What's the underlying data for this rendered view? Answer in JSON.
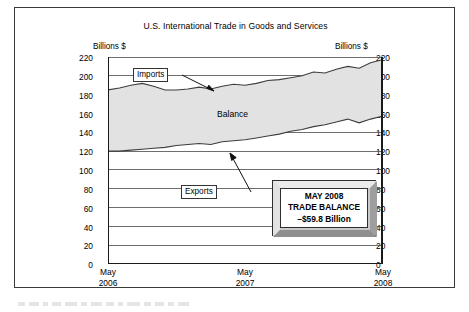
{
  "chart_data": {
    "type": "area",
    "title": "U.S. International Trade in Goods and Services",
    "xlabel": "",
    "ylabel": "Billions $",
    "units_left": "Billions $",
    "units_right": "Billions $",
    "ylim": [
      0,
      220
    ],
    "ytick_step": 20,
    "yticks": [
      0,
      20,
      40,
      60,
      80,
      100,
      120,
      140,
      160,
      180,
      200,
      220
    ],
    "grid": true,
    "grid_orientation": "horizontal",
    "legend_position": "inline-annotations",
    "x_tick_labels": [
      "May 2006",
      "May 2007",
      "May 2008"
    ],
    "x_tick_lines": [
      [
        "May",
        "2006"
      ],
      [
        "May",
        "2007"
      ],
      [
        "May",
        "2008"
      ]
    ],
    "x_minor_ticks": "monthly",
    "x": [
      "2006-05",
      "2006-06",
      "2006-07",
      "2006-08",
      "2006-09",
      "2006-10",
      "2006-11",
      "2006-12",
      "2007-01",
      "2007-02",
      "2007-03",
      "2007-04",
      "2007-05",
      "2007-06",
      "2007-07",
      "2007-08",
      "2007-09",
      "2007-10",
      "2007-11",
      "2007-12",
      "2008-01",
      "2008-02",
      "2008-03",
      "2008-04",
      "2008-05"
    ],
    "series": [
      {
        "name": "Imports",
        "values": [
          185,
          187,
          190,
          192,
          189,
          185,
          185,
          186,
          188,
          186,
          189,
          191,
          190,
          192,
          195,
          196,
          198,
          200,
          204,
          203,
          207,
          210,
          208,
          214,
          217
        ]
      },
      {
        "name": "Exports",
        "values": [
          120,
          120,
          121,
          122,
          123,
          124,
          126,
          127,
          128,
          127,
          130,
          131,
          132,
          134,
          136,
          138,
          141,
          143,
          146,
          148,
          151,
          154,
          150,
          154,
          157
        ]
      }
    ],
    "shaded_region": {
      "name": "Balance",
      "label": "Balance",
      "between": [
        "Exports",
        "Imports"
      ],
      "color": "#e0e0e0"
    },
    "annotations": [
      {
        "name": "imports-callout",
        "text": "Imports",
        "boxed": true,
        "arrow": true
      },
      {
        "name": "exports-callout",
        "text": "Exports",
        "boxed": true,
        "arrow": true
      },
      {
        "name": "balance-label",
        "text": "Balance",
        "boxed": false,
        "arrow": false
      }
    ],
    "data_box": {
      "line1": "MAY 2008",
      "line2": "TRADE BALANCE",
      "line3": "–$59.8 Billion",
      "value": -59.8,
      "units": "Billion"
    }
  }
}
